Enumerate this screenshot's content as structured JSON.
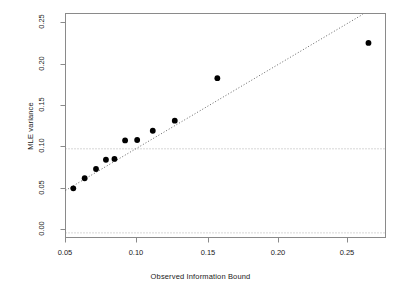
{
  "chart_data": {
    "type": "scatter",
    "title": "",
    "xlabel": "Observed Information Bound",
    "ylabel": "MLE variance",
    "xlim": [
      0.0505,
      0.276
    ],
    "ylim": [
      -0.0055,
      0.261
    ],
    "xticks": [
      0.05,
      0.1,
      0.15,
      0.2,
      0.25
    ],
    "xticklabels": [
      "0.05",
      "0.10",
      "0.15",
      "0.20",
      "0.25"
    ],
    "yticks": [
      0.0,
      0.05,
      0.1,
      0.15,
      0.2,
      0.25
    ],
    "yticklabels": [
      "0.00",
      "0.05",
      "0.10",
      "0.15",
      "0.20",
      "0.25"
    ],
    "grid": false,
    "legend": null,
    "point_color": "#000000",
    "point_marker": "filled-circle",
    "points": [
      {
        "x": 0.056,
        "y": 0.053
      },
      {
        "x": 0.064,
        "y": 0.065
      },
      {
        "x": 0.072,
        "y": 0.076
      },
      {
        "x": 0.079,
        "y": 0.087
      },
      {
        "x": 0.085,
        "y": 0.088
      },
      {
        "x": 0.0925,
        "y": 0.11
      },
      {
        "x": 0.101,
        "y": 0.1105
      },
      {
        "x": 0.112,
        "y": 0.1215
      },
      {
        "x": 0.1275,
        "y": 0.1335
      },
      {
        "x": 0.1575,
        "y": 0.184
      },
      {
        "x": 0.264,
        "y": 0.226
      }
    ],
    "reference_lines": [
      {
        "name": "identity-line",
        "kind": "diagonal",
        "style": "dotted",
        "color": "#555555",
        "slope": 1,
        "intercept": 0,
        "x_from": 0.0505,
        "x_to": 0.26
      },
      {
        "name": "hline-zero",
        "kind": "horizontal",
        "style": "dotted",
        "color": "#999999",
        "y": 0.0
      },
      {
        "name": "hline-tenth",
        "kind": "horizontal",
        "style": "dotted",
        "color": "#999999",
        "y": 0.1
      }
    ],
    "frame_color": "#888888"
  },
  "plot": {
    "xlabel": "Observed Information Bound",
    "ylabel": "MLE variance",
    "xticks": [
      {
        "label": "0.05",
        "px": 65
      },
      {
        "label": "0.10",
        "px": 136
      },
      {
        "label": "0.15",
        "px": 208
      },
      {
        "label": "0.20",
        "px": 278
      },
      {
        "label": "0.25",
        "px": 347
      }
    ],
    "yticks": [
      {
        "label": "0.00",
        "px": 229
      },
      {
        "label": "0.05",
        "px": 188
      },
      {
        "label": "0.10",
        "px": 146
      },
      {
        "label": "0.15",
        "px": 105
      },
      {
        "label": "0.20",
        "px": 64
      },
      {
        "label": "0.25",
        "px": 22
      }
    ]
  }
}
